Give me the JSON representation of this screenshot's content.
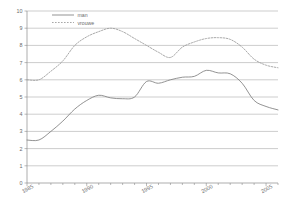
{
  "chart_data": {
    "type": "line",
    "title": "",
    "xlabel": "",
    "ylabel": "",
    "xlim": [
      1985,
      2006
    ],
    "ylim": [
      0,
      10
    ],
    "yticks": [
      0,
      1,
      2,
      3,
      4,
      5,
      6,
      7,
      8,
      9,
      10
    ],
    "ytick_labels": [
      "0",
      "1",
      "2",
      "3",
      "4",
      "5",
      "6",
      "7",
      "8",
      "9",
      "10"
    ],
    "xticks": [
      1985,
      1990,
      1995,
      2000,
      2005
    ],
    "xtick_labels": [
      "1985",
      "1990",
      "1995",
      "2000",
      "2005"
    ],
    "x_minor_step": 1,
    "grid": "horizontal",
    "legend_position": "top-left-inside",
    "series": [
      {
        "name": "man",
        "style": "solid",
        "color": "#808080",
        "x": [
          1985,
          1986,
          1987,
          1988,
          1989,
          1990,
          1991,
          1992,
          1993,
          1994,
          1995,
          1996,
          1997,
          1998,
          1999,
          2000,
          2001,
          2002,
          2003,
          2004,
          2005,
          2006
        ],
        "values": [
          2.5,
          2.5,
          3.0,
          3.6,
          4.3,
          4.8,
          5.1,
          4.95,
          4.9,
          5.0,
          5.9,
          5.8,
          6.0,
          6.15,
          6.2,
          6.55,
          6.4,
          6.35,
          5.8,
          4.8,
          4.45,
          4.25
        ]
      },
      {
        "name": "vrouwe",
        "style": "dashed",
        "color": "#9a9a9a",
        "x": [
          1985,
          1986,
          1987,
          1988,
          1989,
          1990,
          1991,
          1992,
          1993,
          1994,
          1995,
          1996,
          1997,
          1998,
          1999,
          2000,
          2001,
          2002,
          2003,
          2004,
          2005,
          2006
        ],
        "values": [
          6.0,
          6.0,
          6.5,
          7.1,
          8.0,
          8.5,
          8.8,
          9.0,
          8.8,
          8.4,
          8.0,
          7.6,
          7.3,
          7.9,
          8.2,
          8.4,
          8.45,
          8.35,
          7.9,
          7.2,
          6.85,
          6.7
        ]
      }
    ],
    "legend": [
      {
        "label": "man",
        "style": "solid",
        "color": "#808080"
      },
      {
        "label": "vrouwe",
        "style": "dashed",
        "color": "#9a9a9a"
      }
    ]
  },
  "axis": {
    "y_axis_name": "y-axis",
    "x_axis_name": "x-axis"
  }
}
